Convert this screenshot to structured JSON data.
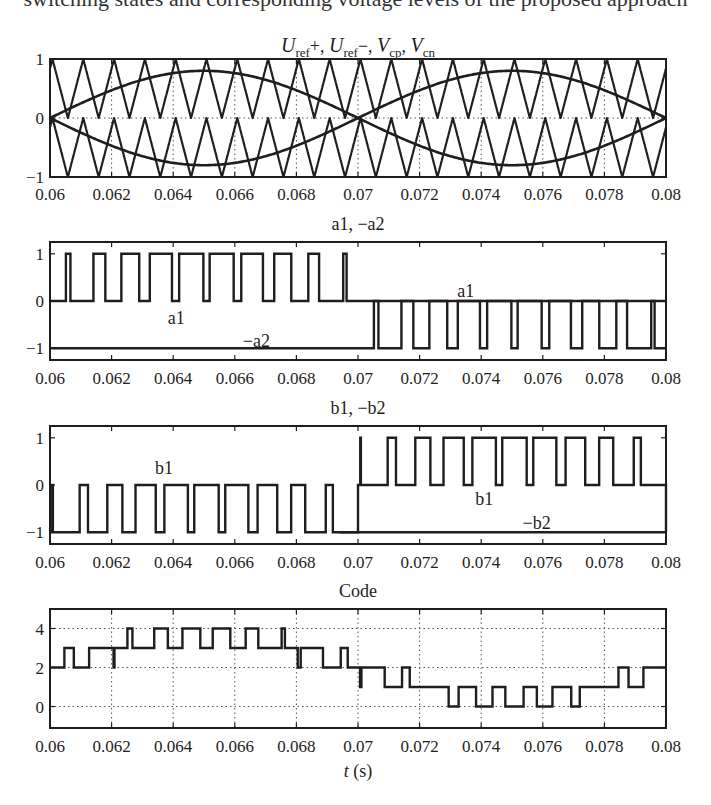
{
  "page": {
    "top_cut_text": "switching states and corresponding voltage levels of the proposed approach"
  },
  "chart_data": [
    {
      "id": "panel1",
      "type": "line",
      "title": "U_ref+, U_ref−, V_cp, V_cn",
      "title_parts": [
        {
          "t": "U",
          "style": "italic"
        },
        {
          "t": "ref",
          "style": "sub"
        },
        {
          "t": "+, ",
          "style": "normal"
        },
        {
          "t": "U",
          "style": "italic"
        },
        {
          "t": "ref",
          "style": "sub"
        },
        {
          "t": "−, ",
          "style": "normal"
        },
        {
          "t": "V",
          "style": "italic"
        },
        {
          "t": "cp",
          "style": "sub"
        },
        {
          "t": ", ",
          "style": "normal"
        },
        {
          "t": "V",
          "style": "italic"
        },
        {
          "t": "cn",
          "style": "sub"
        }
      ],
      "xlabel": "",
      "ylabel": "",
      "xlim": [
        0.06,
        0.08
      ],
      "ylim": [
        -1,
        1
      ],
      "xticks": [
        0.06,
        0.062,
        0.064,
        0.066,
        0.068,
        0.07,
        0.072,
        0.074,
        0.076,
        0.078,
        0.08
      ],
      "xtick_labels": [
        "0.06",
        "0.062",
        "0.064",
        "0.066",
        "0.068",
        "0.07",
        "0.072",
        "0.074",
        "0.076",
        "0.078",
        "0.08"
      ],
      "yticks": [
        -1,
        0,
        1
      ],
      "ytick_labels": [
        "−1",
        "0",
        "1"
      ],
      "grid": {
        "x": true,
        "y": [
          0
        ]
      },
      "series": [
        {
          "name": "U_ref+",
          "kind": "rectified_sine",
          "amplitude": 0.8,
          "frequency_hz": 50,
          "sign": 1
        },
        {
          "name": "U_ref−",
          "kind": "rectified_sine",
          "amplitude": 0.8,
          "frequency_hz": 50,
          "sign": -1
        },
        {
          "name": "V_cp",
          "kind": "triangle",
          "min": 0,
          "max": 1,
          "frequency_hz": 1000,
          "phase_s": 8e-05
        },
        {
          "name": "V_cn",
          "kind": "triangle",
          "min": -1,
          "max": 0,
          "frequency_hz": 1000,
          "phase_s": 8e-05
        }
      ],
      "sampled": {
        "t": [
          0.06,
          0.0625,
          0.065,
          0.0675,
          0.07,
          0.0725,
          0.075,
          0.0775,
          0.08
        ],
        "U_ref+": [
          0.0,
          0.57,
          0.8,
          0.57,
          0.0,
          0.57,
          0.8,
          0.57,
          0.0
        ],
        "U_ref−": [
          0.0,
          -0.57,
          -0.8,
          -0.57,
          0.0,
          -0.57,
          -0.8,
          -0.57,
          0.0
        ]
      }
    },
    {
      "id": "panel2",
      "type": "line",
      "title": "a1, −a2",
      "xlim": [
        0.06,
        0.08
      ],
      "ylim": [
        -1.25,
        1.25
      ],
      "xticks": [
        0.06,
        0.062,
        0.064,
        0.066,
        0.068,
        0.07,
        0.072,
        0.074,
        0.076,
        0.078,
        0.08
      ],
      "xtick_labels": [
        "0.06",
        "0.062",
        "0.064",
        "0.066",
        "0.068",
        "0.07",
        "0.072",
        "0.074",
        "0.076",
        "0.078",
        "0.08"
      ],
      "yticks": [
        -1,
        0,
        1
      ],
      "ytick_labels": [
        "−1",
        "0",
        "1"
      ],
      "grid": {
        "x": false,
        "y": []
      },
      "series": [
        {
          "name": "a1",
          "kind": "pwm_pos_half",
          "levels": [
            0,
            1
          ],
          "description": "PWM pulses 0↔1 during 0.06–0.07, holds 0 during 0.07–0.08"
        },
        {
          "name": "−a2",
          "kind": "pwm_neg_half",
          "levels": [
            -1,
            0
          ],
          "description": "holds −1 during 0.06–0.07, PWM pulses −1↔0 during 0.07–0.08"
        }
      ],
      "annotations": [
        {
          "text": "a1",
          "x": 0.0641,
          "y": -0.35
        },
        {
          "text": "−a2",
          "x": 0.0667,
          "y": -0.85
        },
        {
          "text": "a1",
          "x": 0.0735,
          "y": 0.22
        }
      ]
    },
    {
      "id": "panel3",
      "type": "line",
      "title": "b1, −b2",
      "xlim": [
        0.06,
        0.08
      ],
      "ylim": [
        -1.25,
        1.25
      ],
      "xticks": [
        0.06,
        0.062,
        0.064,
        0.066,
        0.068,
        0.07,
        0.072,
        0.074,
        0.076,
        0.078,
        0.08
      ],
      "xtick_labels": [
        "0.06",
        "0.062",
        "0.064",
        "0.066",
        "0.068",
        "0.07",
        "0.072",
        "0.074",
        "0.076",
        "0.078",
        "0.08"
      ],
      "yticks": [
        -1,
        0,
        1
      ],
      "ytick_labels": [
        "−1",
        "0",
        "1"
      ],
      "grid": {
        "x": false,
        "y": []
      },
      "series": [
        {
          "name": "b1",
          "kind": "pwm",
          "levels": [
            -1,
            0,
            1
          ],
          "description": "pulses 0↔−1 during 0.06–0.07, pulses 0↔1 during 0.07–0.08"
        },
        {
          "name": "−b2",
          "kind": "constant_second_half",
          "levels": [
            -1
          ],
          "description": "holds −1 during 0.07–0.08"
        }
      ],
      "annotations": [
        {
          "text": "b1",
          "x": 0.0637,
          "y": 0.35
        },
        {
          "text": "b1",
          "x": 0.0741,
          "y": -0.3
        },
        {
          "text": "−b2",
          "x": 0.0758,
          "y": -0.8
        }
      ]
    },
    {
      "id": "panel4",
      "type": "line",
      "title": "Code",
      "xlabel": "t (s)",
      "xlim": [
        0.06,
        0.08
      ],
      "ylim": [
        -1.1,
        5
      ],
      "xticks": [
        0.06,
        0.062,
        0.064,
        0.066,
        0.068,
        0.07,
        0.072,
        0.074,
        0.076,
        0.078,
        0.08
      ],
      "xtick_labels": [
        "0.06",
        "0.062",
        "0.064",
        "0.066",
        "0.068",
        "0.07",
        "0.072",
        "0.074",
        "0.076",
        "0.078",
        "0.08"
      ],
      "yticks": [
        0,
        2,
        4
      ],
      "ytick_labels": [
        "0",
        "2",
        "4"
      ],
      "grid": {
        "x": true,
        "y": [
          0,
          2,
          4
        ]
      },
      "series": [
        {
          "name": "Code",
          "kind": "multilevel_pwm",
          "offset": 2,
          "amplitude": 1.6,
          "frequency_hz": 50,
          "carrier_hz": 1000
        }
      ],
      "level_bands": [
        {
          "t_start": 0.06,
          "t_end": 0.0621,
          "levels": [
            2,
            3
          ]
        },
        {
          "t_start": 0.0621,
          "t_end": 0.0679,
          "levels": [
            3,
            4
          ]
        },
        {
          "t_start": 0.0679,
          "t_end": 0.07,
          "levels": [
            2,
            3
          ]
        },
        {
          "t_start": 0.07,
          "t_end": 0.0721,
          "levels": [
            1,
            2
          ]
        },
        {
          "t_start": 0.0721,
          "t_end": 0.0779,
          "levels": [
            0,
            1
          ]
        },
        {
          "t_start": 0.0779,
          "t_end": 0.08,
          "levels": [
            1,
            2
          ]
        }
      ]
    }
  ],
  "layout": {
    "plot_left": 50,
    "plot_right": 666,
    "panels": [
      {
        "top": 59,
        "bottom": 177,
        "title_y": 52,
        "tick_label_y": 200
      },
      {
        "top": 242,
        "bottom": 360,
        "title_y": 230,
        "tick_label_y": 384
      },
      {
        "top": 426,
        "bottom": 544,
        "title_y": 414,
        "tick_label_y": 568
      },
      {
        "top": 609,
        "bottom": 728,
        "title_y": 597,
        "tick_label_y": 752,
        "xlabel_y": 777
      }
    ]
  }
}
